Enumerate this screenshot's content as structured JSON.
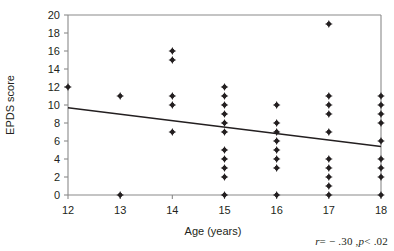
{
  "chart_data": {
    "type": "scatter",
    "title": "",
    "xlabel": "Age (years)",
    "ylabel": "EPDS score",
    "xlim": [
      12,
      18
    ],
    "ylim": [
      0,
      20
    ],
    "xticks": [
      12,
      13,
      14,
      15,
      16,
      17,
      18
    ],
    "yticks": [
      0,
      2,
      4,
      6,
      8,
      10,
      12,
      14,
      16,
      18,
      20
    ],
    "grid": false,
    "legend": null,
    "points": [
      {
        "x": 12,
        "y": 12
      },
      {
        "x": 13,
        "y": 11
      },
      {
        "x": 13,
        "y": 0
      },
      {
        "x": 14,
        "y": 16
      },
      {
        "x": 14,
        "y": 15
      },
      {
        "x": 14,
        "y": 11
      },
      {
        "x": 14,
        "y": 10
      },
      {
        "x": 14,
        "y": 7
      },
      {
        "x": 15,
        "y": 12
      },
      {
        "x": 15,
        "y": 11
      },
      {
        "x": 15,
        "y": 10
      },
      {
        "x": 15,
        "y": 9
      },
      {
        "x": 15,
        "y": 8
      },
      {
        "x": 15,
        "y": 7
      },
      {
        "x": 15,
        "y": 5
      },
      {
        "x": 15,
        "y": 4
      },
      {
        "x": 15,
        "y": 3
      },
      {
        "x": 15,
        "y": 2
      },
      {
        "x": 15,
        "y": 0
      },
      {
        "x": 16,
        "y": 10
      },
      {
        "x": 16,
        "y": 8
      },
      {
        "x": 16,
        "y": 7
      },
      {
        "x": 16,
        "y": 6
      },
      {
        "x": 16,
        "y": 5
      },
      {
        "x": 16,
        "y": 4
      },
      {
        "x": 16,
        "y": 3
      },
      {
        "x": 16,
        "y": 0
      },
      {
        "x": 17,
        "y": 19
      },
      {
        "x": 17,
        "y": 11
      },
      {
        "x": 17,
        "y": 10
      },
      {
        "x": 17,
        "y": 9
      },
      {
        "x": 17,
        "y": 7
      },
      {
        "x": 17,
        "y": 4
      },
      {
        "x": 17,
        "y": 3
      },
      {
        "x": 17,
        "y": 2
      },
      {
        "x": 17,
        "y": 1
      },
      {
        "x": 17,
        "y": 0
      },
      {
        "x": 18,
        "y": 11
      },
      {
        "x": 18,
        "y": 10
      },
      {
        "x": 18,
        "y": 9
      },
      {
        "x": 18,
        "y": 8
      },
      {
        "x": 18,
        "y": 6
      },
      {
        "x": 18,
        "y": 4
      },
      {
        "x": 18,
        "y": 3
      },
      {
        "x": 18,
        "y": 2
      },
      {
        "x": 18,
        "y": 0
      }
    ],
    "trendline": {
      "x_start": 12,
      "y_start": 9.7,
      "x_end": 18,
      "y_end": 5.4
    },
    "annotation": {
      "r_symbol": "r",
      "r_text": "= − .30 ,",
      "p_symbol": "p",
      "p_text": "< .02",
      "full_text": "r = − .30 , p < .02"
    }
  }
}
